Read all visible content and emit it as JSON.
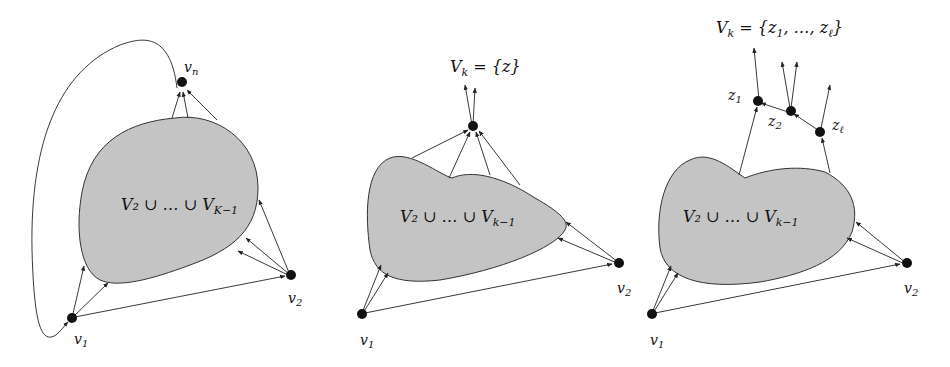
{
  "figure": {
    "panels": [
      {
        "id": "panel-1",
        "region_label": "V₂ ∪ … ∪ V_{K−1}",
        "region_label_main": "V₂ ∪ … ∪ V",
        "region_label_sub": "K−1",
        "nodes": {
          "top": "v",
          "top_sub": "n",
          "left": "v",
          "left_sub": "1",
          "right": "v",
          "right_sub": "2"
        }
      },
      {
        "id": "panel-2",
        "title_main": "V",
        "title_sub": "k",
        "title_rest": " = {z}",
        "region_label_main": "V₂ ∪ … ∪ V",
        "region_label_sub": "k−1",
        "nodes": {
          "left": "v",
          "left_sub": "1",
          "right": "v",
          "right_sub": "2"
        }
      },
      {
        "id": "panel-3",
        "title_main": "V",
        "title_sub": "k",
        "title_rest_a": " = {z",
        "title_rest_sub1": "1",
        "title_rest_b": ", …, z",
        "title_rest_subl": "ℓ",
        "title_rest_c": "}",
        "region_label_main": "V₂ ∪ … ∪ V",
        "region_label_sub": "k−1",
        "nodes": {
          "z1": "z",
          "z1_sub": "1",
          "z2": "z",
          "z2_sub": "2",
          "zl": "z",
          "zl_sub": "ℓ",
          "left": "v",
          "left_sub": "1",
          "right": "v",
          "right_sub": "2"
        }
      }
    ],
    "colors": {
      "region_fill": "#c4c4c4",
      "edge": "#222222",
      "node": "#111111",
      "background": "#ffffff"
    }
  }
}
